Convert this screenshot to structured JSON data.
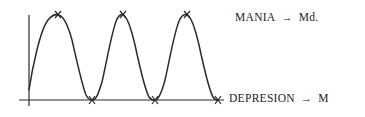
{
  "diagram": {
    "labels": {
      "top": {
        "state": "MANIA",
        "arrow": "→",
        "result": "Md."
      },
      "bottom": {
        "state": "DEPRESION",
        "arrow": "→",
        "result": "M"
      }
    },
    "curve": {
      "peaks_x": [
        58,
        123,
        187
      ],
      "troughs_x": [
        92,
        155,
        218
      ],
      "peak_y": 15,
      "baseline_y": 100,
      "marker": "x-mark"
    },
    "colors": {
      "line": "#2a2a2a",
      "background": "#ffffff"
    }
  }
}
